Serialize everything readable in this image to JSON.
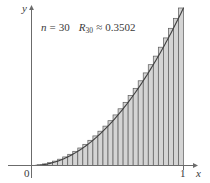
{
  "figure": {
    "name": "riemann-sum-right-endpoint-figure",
    "background_color": "#ffffff"
  },
  "annotation": {
    "n_symbol": "n",
    "equals": "=",
    "n_value": "30",
    "r_symbol": "R",
    "r_subscript": "30",
    "approx_equals": "≈",
    "r_value": "0.3502",
    "full_text": "n = 30    R₃₀ ≈ 0.3502"
  },
  "axes": {
    "x_label": "x",
    "y_label": "y",
    "origin_label": "0",
    "x_tick_labels": [
      "1"
    ],
    "axis_color": "#6b6b6b",
    "label_color": "#3a3a3a"
  },
  "chart_data": {
    "type": "bar",
    "title": "",
    "subtitle": "",
    "xlabel": "x",
    "ylabel": "y",
    "xlim": [
      0,
      1.12
    ],
    "ylim": [
      0,
      1.06
    ],
    "grid": false,
    "legend": false,
    "annotations": [
      "n = 30",
      "R₃₀ ≈ 0.3502"
    ],
    "x_tick_values": [
      0,
      1
    ],
    "x_tick_labels": [
      "0",
      "1"
    ],
    "y_tick_values": [],
    "y_tick_labels": [],
    "n_rectangles": 30,
    "rectangle_rule": "right-endpoint",
    "riemann_sum_value": 0.3502,
    "curve": {
      "name": "y = x^2",
      "expression": "x^2",
      "color": "#3f3f3f",
      "x": [
        0,
        0.05,
        0.1,
        0.15,
        0.2,
        0.25,
        0.3,
        0.35,
        0.4,
        0.45,
        0.5,
        0.55,
        0.6,
        0.65,
        0.7,
        0.75,
        0.8,
        0.85,
        0.9,
        0.95,
        1
      ],
      "y": [
        0,
        0.0025,
        0.01,
        0.0225,
        0.04,
        0.0625,
        0.09,
        0.1225,
        0.16,
        0.2025,
        0.25,
        0.3025,
        0.36,
        0.4225,
        0.49,
        0.5625,
        0.64,
        0.7225,
        0.81,
        0.9025,
        1
      ]
    },
    "bar_fill_color": "#d4d4d4",
    "bar_edge_color": "#5a5a5a",
    "categories": [
      "0.0333",
      "0.0667",
      "0.1000",
      "0.1333",
      "0.1667",
      "0.2000",
      "0.2333",
      "0.2667",
      "0.3000",
      "0.3333",
      "0.3667",
      "0.4000",
      "0.4333",
      "0.4667",
      "0.5000",
      "0.5333",
      "0.5667",
      "0.6000",
      "0.6333",
      "0.6667",
      "0.7000",
      "0.7333",
      "0.7667",
      "0.8000",
      "0.8333",
      "0.8667",
      "0.9000",
      "0.9333",
      "0.9667",
      "1.0000"
    ],
    "values": [
      0.0011,
      0.0044,
      0.01,
      0.0178,
      0.0278,
      0.04,
      0.0544,
      0.0711,
      0.09,
      0.1111,
      0.1344,
      0.16,
      0.1878,
      0.2178,
      0.25,
      0.2844,
      0.3211,
      0.36,
      0.4011,
      0.4444,
      0.49,
      0.5378,
      0.5878,
      0.64,
      0.6944,
      0.7511,
      0.81,
      0.8711,
      0.9344,
      1.0
    ]
  }
}
